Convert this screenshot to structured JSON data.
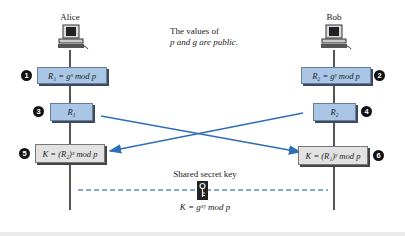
{
  "actors": {
    "alice": {
      "name": "Alice",
      "icon": "computer-icon"
    },
    "bob": {
      "name": "Bob",
      "icon": "computer-icon"
    }
  },
  "public_note": {
    "line1": "The values of",
    "line2": "p and g are public."
  },
  "steps": [
    {
      "num": "1",
      "text": "R₁ = gˣ mod p",
      "side": "alice",
      "color": "#a9c6e6"
    },
    {
      "num": "2",
      "text": "R₂ = gʸ mod p",
      "side": "bob",
      "color": "#a9c6e6"
    },
    {
      "num": "3",
      "text": "R₁",
      "side": "alice",
      "color": "#a9c6e6"
    },
    {
      "num": "4",
      "text": "R₂",
      "side": "bob",
      "color": "#a9c6e6"
    },
    {
      "num": "5",
      "text": "K = (R₂)ˣ mod p",
      "side": "alice",
      "color": "#e2e2e2"
    },
    {
      "num": "6",
      "text": "K = (R₁)ʸ mod p",
      "side": "bob",
      "color": "#e2e2e2"
    }
  ],
  "shared_key": {
    "label": "Shared secret key",
    "formula": "K = gˣʸ mod p",
    "icon": "key-icon"
  },
  "colors": {
    "arrow": "#2f6fb8",
    "dashed": "#5a8fc4"
  }
}
